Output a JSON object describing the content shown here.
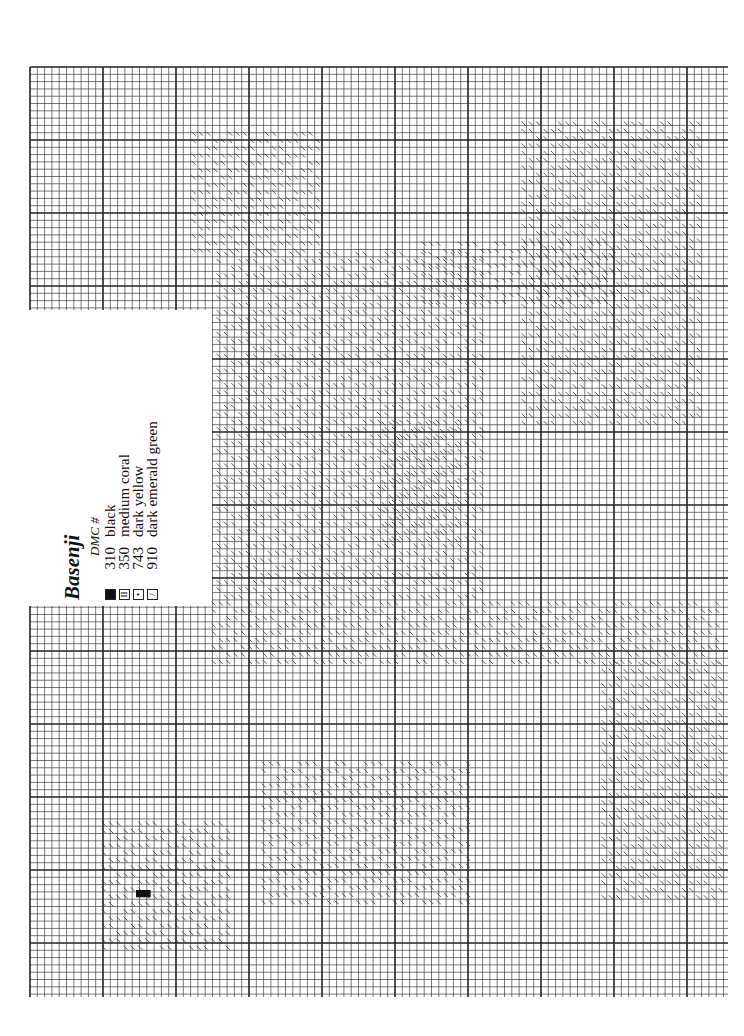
{
  "page": {
    "background": "#ffffff",
    "grid_color": "#222222"
  },
  "legend": {
    "title": "Basenji",
    "header": "DMC #",
    "items": [
      {
        "symbol": "solid-square",
        "glyph": "",
        "dmc": "310",
        "name": "black"
      },
      {
        "symbol": "double-bar",
        "glyph": "II",
        "dmc": "350",
        "name": "medium coral"
      },
      {
        "symbol": "dots",
        "glyph": "•",
        "dmc": "743",
        "name": "dark yellow"
      },
      {
        "symbol": "slash",
        "glyph": "/",
        "dmc": "910",
        "name": "dark emerald green"
      }
    ]
  },
  "chart_data": {
    "type": "heatmap",
    "title": "Basenji",
    "grid": {
      "cell_px": 7.3,
      "major_every": 10
    },
    "key": [
      {
        "symbol": "■",
        "dmc": "310",
        "color_name": "black"
      },
      {
        "symbol": "II",
        "dmc": "350",
        "color_name": "medium coral"
      },
      {
        "symbol": "•",
        "dmc": "743",
        "color_name": "dark yellow"
      },
      {
        "symbol": "/",
        "dmc": "910",
        "color_name": "dark emerald green"
      }
    ]
  }
}
